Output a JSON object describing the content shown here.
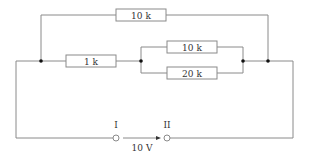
{
  "diagram": {
    "type": "circuit",
    "resistors": {
      "top": {
        "label": "10 k"
      },
      "series": {
        "label": "1 k"
      },
      "parallel_upper": {
        "label": "10 k"
      },
      "parallel_lower": {
        "label": "20 k"
      }
    },
    "terminals": {
      "left": {
        "label": "I"
      },
      "right": {
        "label": "II"
      }
    },
    "voltage": {
      "label": "10 V"
    },
    "colors": {
      "wire": "#8a8a8a",
      "node": "#111111"
    }
  }
}
